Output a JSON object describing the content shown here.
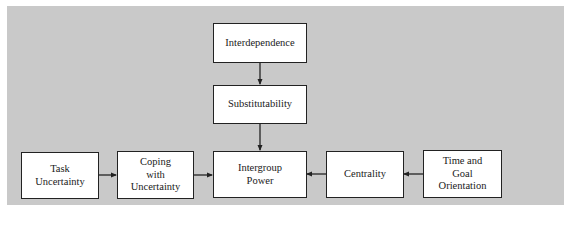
{
  "diagram": {
    "background_color": "#c9c9c9",
    "box_fill": "#ffffff",
    "line_color": "#222222",
    "nodes": [
      {
        "id": "interdependence",
        "label": "Interdependence"
      },
      {
        "id": "substitutability",
        "label": "Substitutability"
      },
      {
        "id": "task_uncertainty",
        "label": "Task\nUncertainty"
      },
      {
        "id": "coping",
        "label": "Coping\nwith\nUncertainty"
      },
      {
        "id": "intergroup_power",
        "label": "Intergroup\nPower"
      },
      {
        "id": "centrality",
        "label": "Centrality"
      },
      {
        "id": "time_goal",
        "label": "Time and\nGoal\nOrientation"
      }
    ],
    "edges": [
      {
        "from": "interdependence",
        "to": "substitutability"
      },
      {
        "from": "substitutability",
        "to": "intergroup_power"
      },
      {
        "from": "task_uncertainty",
        "to": "coping"
      },
      {
        "from": "coping",
        "to": "intergroup_power"
      },
      {
        "from": "centrality",
        "to": "intergroup_power"
      },
      {
        "from": "time_goal",
        "to": "centrality"
      }
    ]
  }
}
